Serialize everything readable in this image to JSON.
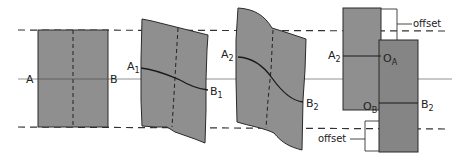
{
  "diagram": {
    "type": "rock-fault-deformation-sequence",
    "colors": {
      "fill": "#8f8f8f",
      "stroke": "#2a2a2a",
      "background": "#ffffff",
      "guide": "#555555"
    },
    "panels": [
      {
        "id": "original",
        "labels": {
          "left": "A",
          "right": "B"
        }
      },
      {
        "id": "slight-bend",
        "labels": {
          "left": "A",
          "left_sub": "1",
          "right": "B",
          "right_sub": "1"
        }
      },
      {
        "id": "strong-bend",
        "labels": {
          "left": "A",
          "left_sub": "2",
          "right": "B",
          "right_sub": "2"
        }
      },
      {
        "id": "faulted",
        "labels": {
          "left": "A",
          "left_sub": "2",
          "oa": "O",
          "oa_sub": "A",
          "ob": "O",
          "ob_sub": "B",
          "right": "B",
          "right_sub": "2",
          "offset_top": "offset",
          "offset_bottom": "offset"
        }
      }
    ]
  }
}
